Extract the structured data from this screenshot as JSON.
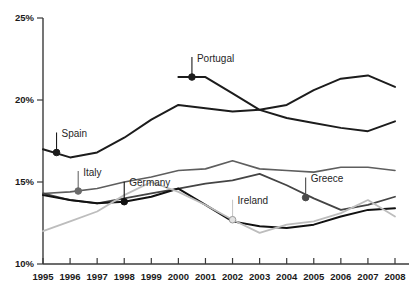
{
  "chart_data": {
    "type": "line",
    "title": "",
    "subtitle": "",
    "xlabel": "",
    "ylabel": "",
    "grid": false,
    "legend_position": "inline-callouts",
    "x": [
      1995,
      1996,
      1997,
      1998,
      1999,
      2000,
      2001,
      2002,
      2003,
      2004,
      2005,
      2006,
      2007,
      2008
    ],
    "xtick_labels": [
      "1995",
      "1996",
      "1997",
      "1998",
      "1999",
      "2000",
      "2001",
      "2002",
      "2003",
      "2004",
      "2005",
      "2006",
      "2007",
      "2008"
    ],
    "ytick_labels": [
      "25%",
      "20%",
      "15%",
      "10%"
    ],
    "ytick_values": [
      25,
      20,
      15,
      10
    ],
    "ylim": [
      10,
      25
    ],
    "xlim": [
      1995,
      2008
    ],
    "series": [
      {
        "name": "Spain",
        "color": "#1c1c1c",
        "width": 2.0,
        "marker": "filled-circle",
        "marker_color": "#1c1c1c",
        "x": [
          1995,
          1996,
          1997,
          1998,
          1999,
          2000,
          2001,
          2002,
          2003,
          2004,
          2005,
          2006,
          2007,
          2008
        ],
        "values": [
          17.0,
          16.5,
          16.8,
          17.7,
          18.8,
          19.7,
          19.5,
          19.3,
          19.4,
          19.7,
          20.6,
          21.3,
          21.5,
          20.8
        ],
        "callout": {
          "label": "Spain",
          "x": 1995.5,
          "y": 16.8
        }
      },
      {
        "name": "Portugal",
        "color": "#1c1c1c",
        "width": 2.0,
        "marker": "filled-circle",
        "marker_color": "#1c1c1c",
        "x": [
          2000,
          2001,
          2002,
          2003,
          2004,
          2005,
          2006,
          2007,
          2008
        ],
        "values": [
          21.4,
          21.4,
          20.4,
          19.4,
          18.9,
          18.6,
          18.3,
          18.1,
          18.7
        ],
        "callout": {
          "label": "Portugal",
          "x": 2000.5,
          "y": 21.4
        }
      },
      {
        "name": "Italy",
        "color": "#5e5e5e",
        "width": 1.6,
        "marker": "filled-circle",
        "marker_color": "#6a6a6a",
        "x": [
          1995,
          1996,
          1997,
          1998,
          1999,
          2000,
          2001,
          2002,
          2003,
          2004,
          2005,
          2006,
          2007,
          2008
        ],
        "values": [
          14.3,
          14.4,
          14.6,
          15.0,
          15.3,
          15.7,
          15.8,
          16.3,
          15.8,
          15.7,
          15.6,
          15.9,
          15.9,
          15.7
        ],
        "callout": {
          "label": "Italy",
          "x": 1996.3,
          "y": 14.45
        }
      },
      {
        "name": "Greece",
        "color": "#444444",
        "width": 1.8,
        "marker": "filled-circle",
        "marker_color": "#4a4a4a",
        "x": [
          1995,
          1996,
          1997,
          1998,
          1999,
          2000,
          2001,
          2002,
          2003,
          2004,
          2005,
          2006,
          2007,
          2008
        ],
        "values": [
          14.3,
          13.9,
          13.7,
          14.0,
          14.3,
          14.6,
          14.9,
          15.1,
          15.5,
          14.8,
          14.0,
          13.3,
          13.6,
          14.1
        ],
        "callout": {
          "label": "Greece",
          "x": 2004.7,
          "y": 14.05
        }
      },
      {
        "name": "Germany",
        "color": "#111111",
        "width": 2.0,
        "marker": "filled-circle",
        "marker_color": "#111111",
        "x": [
          1995,
          1996,
          1997,
          1998,
          1999,
          2000,
          2001,
          2002,
          2003,
          2004,
          2005,
          2006,
          2007,
          2008
        ],
        "values": [
          14.2,
          13.9,
          13.7,
          13.8,
          14.1,
          14.6,
          13.6,
          12.6,
          12.3,
          12.2,
          12.4,
          12.9,
          13.3,
          13.4
        ],
        "callout": {
          "label": "Germany",
          "x": 1998.0,
          "y": 13.8
        }
      },
      {
        "name": "Ireland",
        "color": "#bdbdbd",
        "width": 1.8,
        "marker": "open-circle",
        "marker_color": "#c8c8c8",
        "x": [
          1995,
          1996,
          1997,
          1998,
          1999,
          2000,
          2001,
          2002,
          2003,
          2004,
          2005,
          2006,
          2007,
          2008
        ],
        "values": [
          12.0,
          12.6,
          13.2,
          14.2,
          15.0,
          14.4,
          13.6,
          12.7,
          11.9,
          12.4,
          12.6,
          13.1,
          13.9,
          12.9
        ],
        "callout": {
          "label": "Ireland",
          "x": 2002.0,
          "y": 12.7
        }
      }
    ]
  }
}
